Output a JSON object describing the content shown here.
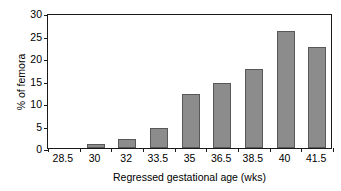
{
  "chart_data": {
    "type": "bar",
    "title": "",
    "subtitle": "",
    "xlabel": "Regressed gestational age (wks)",
    "ylabel": "% of femora",
    "categories": [
      "28.5",
      "30",
      "32",
      "33.5",
      "35",
      "36.5",
      "38.5",
      "40",
      "41.5"
    ],
    "values": [
      0,
      1,
      2,
      4.5,
      12,
      14.5,
      17.5,
      26,
      22.5
    ],
    "ylim": [
      0,
      30
    ],
    "yticks": [
      0,
      5,
      10,
      15,
      20,
      25,
      30
    ],
    "ytick_labels": [
      "0",
      "5",
      "10",
      "15",
      "20",
      "25",
      "30"
    ],
    "grid": false,
    "legend": false,
    "legend_position": "none",
    "bar_color": "#8c8c8c",
    "bar_edge_color": "#585858",
    "axis_color": "#1a1a1a",
    "background_color": "#ffffff"
  }
}
